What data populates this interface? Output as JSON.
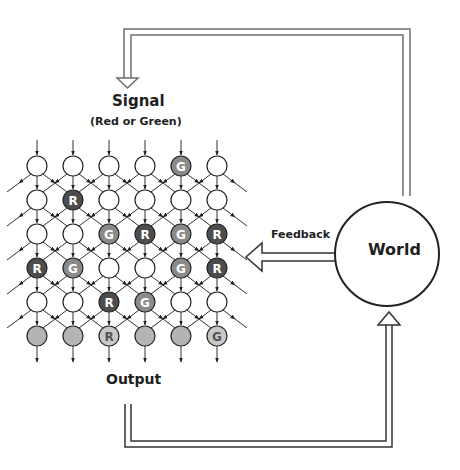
{
  "labels": {
    "signal_title": "Signal",
    "signal_subtitle": "(Red or Green)",
    "feedback": "Feedback",
    "world": "World",
    "output": "Output"
  },
  "colors": {
    "line": "#333333",
    "arrow_outline": "#6e6e6e",
    "node_empty": "#ffffff",
    "node_red": "#4d4d4d",
    "node_green": "#8a8a8a",
    "node_output": "#b4b4b4",
    "node_output_label": "#c8c8c8",
    "letter_light": "#ffffff",
    "letter_dark": "#555555"
  },
  "grid": {
    "columns": 6,
    "rows": 6,
    "legend": {
      "E": "empty",
      "R": "red",
      "G": "green",
      "O": "output",
      "OR": "output-red",
      "OG": "output-green"
    },
    "nodes": [
      [
        "E",
        "E",
        "E",
        "E",
        "G",
        "E"
      ],
      [
        "E",
        "R",
        "E",
        "E",
        "E",
        "E"
      ],
      [
        "E",
        "E",
        "G",
        "R",
        "G",
        "R"
      ],
      [
        "R",
        "G",
        "E",
        "E",
        "G",
        "R"
      ],
      [
        "E",
        "E",
        "R",
        "G",
        "E",
        "E"
      ],
      [
        "O",
        "O",
        "OR",
        "O",
        "O",
        "OG"
      ]
    ]
  }
}
